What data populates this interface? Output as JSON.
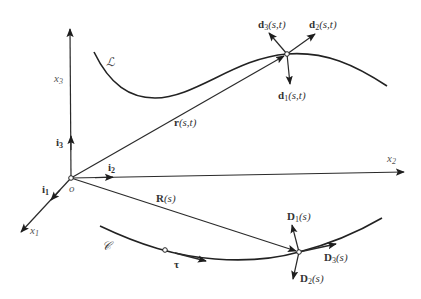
{
  "diagram": {
    "axes": [
      {
        "id": "x1",
        "label": "x",
        "sub": "1"
      },
      {
        "id": "x2",
        "label": "x",
        "sub": "2"
      },
      {
        "id": "x3",
        "label": "x",
        "sub": "3"
      }
    ],
    "basis_vectors": [
      {
        "id": "i1",
        "label": "i",
        "sub": "1"
      },
      {
        "id": "i2",
        "label": "i",
        "sub": "2"
      },
      {
        "id": "i3",
        "label": "i",
        "sub": "3"
      }
    ],
    "origin_label": "o",
    "curves": [
      {
        "id": "L",
        "label": "ℒ",
        "description": "current configuration curve"
      },
      {
        "id": "C",
        "label": "𝒞",
        "description": "reference configuration curve"
      }
    ],
    "position_vectors": [
      {
        "id": "r",
        "label": "r",
        "args": "(s,t)"
      },
      {
        "id": "R",
        "label": "R",
        "args": "(s)"
      }
    ],
    "tangent_label": "τ",
    "current_directors": [
      {
        "id": "d1",
        "label": "d",
        "sub": "1",
        "args": "(s,t)"
      },
      {
        "id": "d2",
        "label": "d",
        "sub": "2",
        "args": "(s,t)"
      },
      {
        "id": "d3",
        "label": "d",
        "sub": "3",
        "args": "(s,t)"
      }
    ],
    "reference_directors": [
      {
        "id": "D1",
        "label": "D",
        "sub": "1",
        "args": "(s)"
      },
      {
        "id": "D2",
        "label": "D",
        "sub": "2",
        "args": "(s)"
      },
      {
        "id": "D3",
        "label": "D",
        "sub": "3",
        "args": "(s)"
      }
    ]
  }
}
